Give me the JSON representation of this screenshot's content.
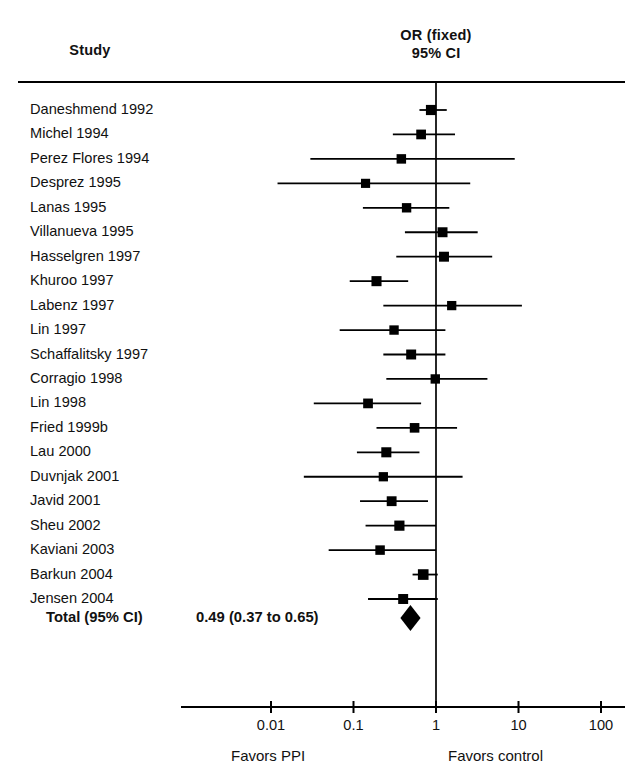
{
  "header": {
    "study_col": "Study",
    "effect_col_line1": "OR (fixed)",
    "effect_col_line2": "95% CI"
  },
  "footer": {
    "left_label": "Favors PPI",
    "right_label": "Favors control"
  },
  "total": {
    "label": "Total (95% CI)",
    "value_text": "0.49 (0.37 to 0.65)"
  },
  "colors": {
    "ink": "#111111",
    "marker": "#000000",
    "axis": "#000000"
  },
  "chart_data": {
    "type": "forest",
    "title": "",
    "xlabel": "",
    "ylabel": "",
    "effect_measure": "OR (fixed)",
    "ci_level": "95% CI",
    "xscale": "log",
    "xlim": [
      0.01,
      100
    ],
    "null_value": 1,
    "ticks": [
      0.01,
      0.1,
      1,
      10,
      100
    ],
    "tick_labels": [
      "0.01",
      "0.1",
      "1",
      "10",
      "100"
    ],
    "grid": false,
    "legend": "none",
    "favors_left": "Favors PPI",
    "favors_right": "Favors control",
    "categories": [
      "Daneshmend 1992",
      "Michel 1994",
      "Perez Flores 1994",
      "Desprez 1995",
      "Lanas 1995",
      "Villanueva 1995",
      "Hasselgren 1997",
      "Khuroo 1997",
      "Labenz 1997",
      "Lin 1997",
      "Schaffalitsky 1997",
      "Corragio 1998",
      "Lin 1998",
      "Fried 1999b",
      "Lau 2000",
      "Duvnjak 2001",
      "Javid 2001",
      "Sheu 2002",
      "Kaviani 2003",
      "Barkun 2004",
      "Jensen 2004"
    ],
    "studies": [
      {
        "name": "Daneshmend 1992",
        "or": 0.87,
        "low": 0.63,
        "high": 1.35,
        "weight": 3.2
      },
      {
        "name": "Michel 1994",
        "or": 0.66,
        "low": 0.3,
        "high": 1.7,
        "weight": 2.8
      },
      {
        "name": "Perez Flores 1994",
        "or": 0.38,
        "low": 0.03,
        "high": 9.0,
        "weight": 2.6
      },
      {
        "name": "Desprez 1995",
        "or": 0.14,
        "low": 0.012,
        "high": 2.6,
        "weight": 2.3
      },
      {
        "name": "Lanas 1995",
        "or": 0.44,
        "low": 0.13,
        "high": 1.45,
        "weight": 2.5
      },
      {
        "name": "Villanueva 1995",
        "or": 1.2,
        "low": 0.42,
        "high": 3.2,
        "weight": 3.0
      },
      {
        "name": "Hasselgren 1997",
        "or": 1.25,
        "low": 0.33,
        "high": 4.8,
        "weight": 3.0
      },
      {
        "name": "Khuroo 1997",
        "or": 0.19,
        "low": 0.09,
        "high": 0.46,
        "weight": 3.1
      },
      {
        "name": "Labenz 1997",
        "or": 1.55,
        "low": 0.23,
        "high": 11.0,
        "weight": 2.4
      },
      {
        "name": "Lin 1997",
        "or": 0.31,
        "low": 0.068,
        "high": 1.3,
        "weight": 2.5
      },
      {
        "name": "Schaffalitsky 1997",
        "or": 0.5,
        "low": 0.23,
        "high": 1.3,
        "weight": 3.0
      },
      {
        "name": "Corragio 1998",
        "or": 0.98,
        "low": 0.25,
        "high": 4.2,
        "weight": 2.5
      },
      {
        "name": "Lin 1998",
        "or": 0.15,
        "low": 0.033,
        "high": 0.66,
        "weight": 2.8
      },
      {
        "name": "Fried 1999b",
        "or": 0.55,
        "low": 0.19,
        "high": 1.8,
        "weight": 2.7
      },
      {
        "name": "Lau 2000",
        "or": 0.25,
        "low": 0.11,
        "high": 0.63,
        "weight": 3.1
      },
      {
        "name": "Duvnjak 2001",
        "or": 0.23,
        "low": 0.025,
        "high": 2.1,
        "weight": 2.4
      },
      {
        "name": "Javid 2001",
        "or": 0.29,
        "low": 0.12,
        "high": 0.8,
        "weight": 2.9
      },
      {
        "name": "Sheu 2002",
        "or": 0.36,
        "low": 0.14,
        "high": 1.0,
        "weight": 3.2
      },
      {
        "name": "Kaviani 2003",
        "or": 0.21,
        "low": 0.05,
        "high": 1.0,
        "weight": 2.6
      },
      {
        "name": "Barkun 2004",
        "or": 0.7,
        "low": 0.52,
        "high": 1.05,
        "weight": 3.6
      },
      {
        "name": "Jensen 2004",
        "or": 0.4,
        "low": 0.15,
        "high": 1.05,
        "weight": 3.0
      }
    ],
    "summary": {
      "label": "Total (95% CI)",
      "or": 0.49,
      "low": 0.37,
      "high": 0.65,
      "text": "0.49 (0.37 to 0.65)"
    }
  }
}
